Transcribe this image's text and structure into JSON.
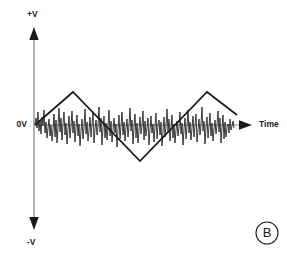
{
  "figure": {
    "panel_id": "B",
    "background_color": "#ffffff",
    "axis_color": "#8c8c8c",
    "axis_arrow_color": "#1a1a1a",
    "signal_color": "#1a1a1a",
    "noise_color": "#1a1a1a",
    "labels": {
      "y_top": "+V",
      "y_zero": "0V",
      "y_bottom": "-V",
      "x_axis": "Time"
    }
  },
  "chart_data": {
    "type": "line",
    "title": "",
    "subtitle": "",
    "xlabel": "Time",
    "ylabel": "",
    "grid": false,
    "legend_position": "none",
    "annotations": [
      {
        "text": "+V",
        "position": "y-axis-top"
      },
      {
        "text": "0V",
        "position": "y-axis-origin"
      },
      {
        "text": "-V",
        "position": "y-axis-bottom"
      },
      {
        "text": "Time",
        "position": "x-axis-end"
      },
      {
        "text": "B",
        "position": "bottom-right",
        "style": "circled"
      }
    ],
    "axis_ranges": {
      "x": [
        0,
        100
      ],
      "y": [
        -1,
        1
      ]
    },
    "y_tick_labels": [
      "+V",
      "0V",
      "-V"
    ],
    "x_tick_labels": [],
    "series": [
      {
        "name": "triangle-wave-signal",
        "type": "line",
        "description": "Clean triangular carrier waveform, one and a half periods, peak amplitude about 0.62 of +V",
        "points_px": [
          [
            35,
            125
          ],
          [
            73,
            92
          ],
          [
            140,
            161
          ],
          [
            207,
            92
          ],
          [
            237,
            115
          ]
        ],
        "x": [
          0.0,
          17.5,
          48.4,
          79.3,
          93.1
        ],
        "y": [
          0.0,
          0.62,
          -0.68,
          0.62,
          0.19
        ]
      },
      {
        "name": "noise-waveform",
        "type": "line",
        "description": "High frequency random noise superimposed on the zero volt line, spanning the full time axis",
        "x_start_px": 35,
        "x_end_px": 234,
        "baseline_px": 125,
        "y_px": [
          125,
          118,
          128,
          112,
          131,
          121,
          134,
          117,
          126,
          110,
          133,
          122,
          138,
          128,
          119,
          136,
          125,
          141,
          130,
          114,
          137,
          120,
          143,
          127,
          108,
          132,
          118,
          140,
          124,
          112,
          135,
          123,
          144,
          129,
          116,
          138,
          126,
          111,
          133,
          121,
          142,
          128,
          115,
          136,
          124,
          146,
          131,
          119,
          139,
          127,
          109,
          134,
          122,
          141,
          130,
          117,
          137,
          125,
          113,
          143,
          129,
          120,
          135,
          126,
          107,
          132,
          118,
          145,
          128,
          116,
          138,
          123,
          140,
          127,
          110,
          136,
          121,
          142,
          130,
          118,
          133,
          124,
          147,
          129,
          115,
          139,
          126,
          112,
          135,
          122,
          141,
          128,
          119,
          137,
          125,
          108,
          131,
          120,
          144,
          127,
          114,
          138,
          123,
          143,
          130,
          117,
          134,
          126,
          111,
          140,
          121,
          136,
          128,
          118,
          145,
          129,
          116,
          133,
          124,
          142,
          127,
          113,
          139,
          125,
          120,
          135,
          122,
          146,
          131,
          117,
          137,
          126,
          109,
          132,
          119,
          141,
          128,
          115,
          138,
          124,
          143,
          130,
          121,
          136,
          127,
          112,
          134,
          123,
          145,
          129,
          118,
          139,
          126,
          110,
          133,
          122,
          140,
          128,
          116,
          137,
          125,
          114,
          142,
          130,
          119,
          135,
          124,
          107,
          131,
          121,
          144,
          127,
          117,
          138,
          126,
          113,
          136,
          123,
          141,
          129,
          120,
          134,
          125,
          111,
          132,
          118,
          143,
          128,
          115,
          139,
          122,
          137,
          127,
          124,
          133,
          119,
          130,
          126,
          121,
          128
        ]
      }
    ]
  }
}
